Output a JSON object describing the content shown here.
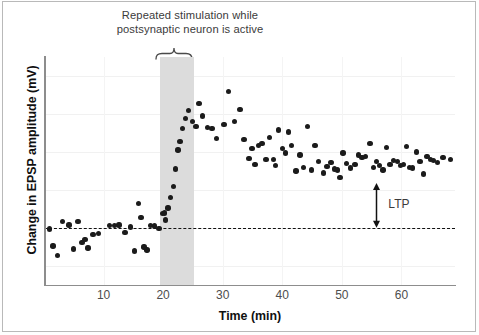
{
  "figure": {
    "stim_caption": "Repeated stimulation while\npostsynaptic neuron is active",
    "ltp_label": "LTP",
    "x_axis_title": "Time (min)",
    "y_axis_title": "Change in EPSP amplitude (mV)"
  },
  "colors": {
    "dot": "#1b1b1b",
    "band": "#dcdcdc",
    "axis": "#8d8d8d",
    "grid": "#f1f1f1",
    "frame": "#b9b9b9",
    "caption_text": "#3b3b3b"
  },
  "chart_data": {
    "type": "scatter",
    "title": "Repeated stimulation while postsynaptic neuron is active",
    "xlabel": "Time (min)",
    "ylabel": "Change in EPSP amplitude (mV)",
    "xlim": [
      0,
      69
    ],
    "ylim": [
      -3,
      9
    ],
    "grid": true,
    "legend": null,
    "xticks": [
      10,
      20,
      30,
      40,
      50,
      60
    ],
    "yticks": [],
    "baseline_y": 0,
    "baseline_style": "dashed",
    "annotations": [
      {
        "name": "stimulation-band",
        "type": "vspan",
        "x_start": 19.5,
        "x_end": 25.2,
        "label": "Repeated stimulation while postsynaptic neuron is active"
      },
      {
        "name": "ltp-arrow",
        "type": "double-arrow",
        "x": 55.8,
        "y_start": 0,
        "y_end": 2.35,
        "label": "LTP"
      }
    ],
    "points": [
      [
        0.9,
        -0.05
      ],
      [
        1.5,
        -0.95
      ],
      [
        2.3,
        -1.45
      ],
      [
        3.1,
        0.35
      ],
      [
        4.2,
        0.15
      ],
      [
        5.0,
        -1.1
      ],
      [
        5.7,
        0.35
      ],
      [
        6.4,
        -0.75
      ],
      [
        6.9,
        -0.62
      ],
      [
        7.4,
        -1.05
      ],
      [
        8.2,
        -0.35
      ],
      [
        9.1,
        -0.3
      ],
      [
        11.0,
        0.12
      ],
      [
        11.8,
        0.12
      ],
      [
        12.6,
        0.15
      ],
      [
        13.6,
        -0.25
      ],
      [
        14.5,
        0.05
      ],
      [
        15.2,
        -1.2
      ],
      [
        15.9,
        1.3
      ],
      [
        16.3,
        0.55
      ],
      [
        16.8,
        -1.0
      ],
      [
        17.3,
        -1.15
      ],
      [
        17.9,
        0.12
      ],
      [
        18.6,
        0.1
      ],
      [
        19.3,
        -0.02
      ],
      [
        19.9,
        0.75
      ],
      [
        20.2,
        0.78
      ],
      [
        20.4,
        0.42
      ],
      [
        20.8,
        1.05
      ],
      [
        21.2,
        1.6
      ],
      [
        21.7,
        2.2
      ],
      [
        22.1,
        3.1
      ],
      [
        22.5,
        4.1
      ],
      [
        22.8,
        4.55
      ],
      [
        23.3,
        5.25
      ],
      [
        23.8,
        5.75
      ],
      [
        24.3,
        6.2
      ],
      [
        24.9,
        5.6
      ],
      [
        25.5,
        5.35
      ],
      [
        26.0,
        6.55
      ],
      [
        26.6,
        5.9
      ],
      [
        27.4,
        5.3
      ],
      [
        28.2,
        5.25
      ],
      [
        29.0,
        4.7
      ],
      [
        30.2,
        5.45
      ],
      [
        31.0,
        7.2
      ],
      [
        32.0,
        5.6
      ],
      [
        32.9,
        6.25
      ],
      [
        33.6,
        4.65
      ],
      [
        34.4,
        3.65
      ],
      [
        34.9,
        4.2
      ],
      [
        35.4,
        3.35
      ],
      [
        36.0,
        4.35
      ],
      [
        36.6,
        4.45
      ],
      [
        37.3,
        3.6
      ],
      [
        37.9,
        4.75
      ],
      [
        38.5,
        3.6
      ],
      [
        38.9,
        3.3
      ],
      [
        39.4,
        5.15
      ],
      [
        40.0,
        4.2
      ],
      [
        40.5,
        3.95
      ],
      [
        41.0,
        5.05
      ],
      [
        41.6,
        4.35
      ],
      [
        42.3,
        3.0
      ],
      [
        43.0,
        3.85
      ],
      [
        43.6,
        3.2
      ],
      [
        44.2,
        5.35
      ],
      [
        44.9,
        3.05
      ],
      [
        45.5,
        4.35
      ],
      [
        46.1,
        3.5
      ],
      [
        46.9,
        2.9
      ],
      [
        47.5,
        3.25
      ],
      [
        48.2,
        3.45
      ],
      [
        48.8,
        3.1
      ],
      [
        49.3,
        3.05
      ],
      [
        49.7,
        2.65
      ],
      [
        50.2,
        3.95
      ],
      [
        50.8,
        3.4
      ],
      [
        51.5,
        3.15
      ],
      [
        52.2,
        3.35
      ],
      [
        52.8,
        3.85
      ],
      [
        53.4,
        3.7
      ],
      [
        54.0,
        3.75
      ],
      [
        54.7,
        4.45
      ],
      [
        55.3,
        3.2
      ],
      [
        55.8,
        3.5
      ],
      [
        56.3,
        3.3
      ],
      [
        56.9,
        3.05
      ],
      [
        57.5,
        4.25
      ],
      [
        58.1,
        3.35
      ],
      [
        58.7,
        3.55
      ],
      [
        59.3,
        3.5
      ],
      [
        59.9,
        3.3
      ],
      [
        60.4,
        3.35
      ],
      [
        60.9,
        4.3
      ],
      [
        61.4,
        3.2
      ],
      [
        61.9,
        3.15
      ],
      [
        62.5,
        4.0
      ],
      [
        63.1,
        3.5
      ],
      [
        63.7,
        2.85
      ],
      [
        64.3,
        3.75
      ],
      [
        64.9,
        3.6
      ],
      [
        65.4,
        3.55
      ],
      [
        66.1,
        3.45
      ],
      [
        67.0,
        3.7
      ],
      [
        68.2,
        3.6
      ]
    ]
  }
}
